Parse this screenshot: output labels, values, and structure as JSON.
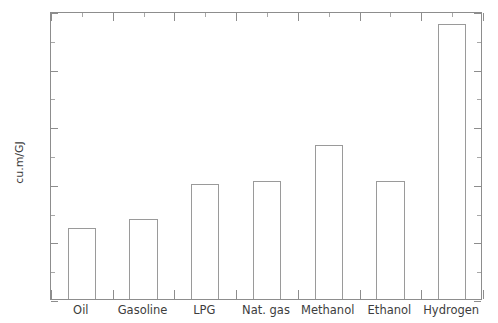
{
  "chart_data": {
    "type": "bar",
    "title": "",
    "subtitle": "",
    "xlabel": "",
    "ylabel": "cu.m/GJ",
    "categories": [
      "Oil",
      "Gasoline",
      "LPG",
      "Nat. gas",
      "Methanol",
      "Ethanol",
      "Hydrogen"
    ],
    "values": [
      0.0247,
      0.0278,
      0.0399,
      0.041,
      0.0535,
      0.041,
      0.0955
    ],
    "ylim": [
      0,
      0.1
    ],
    "xlim": [
      0,
      7
    ],
    "ytick_values": [
      0,
      0.02,
      0.04,
      0.06,
      0.08,
      0.1
    ],
    "ytick_labels": [
      "0",
      "0.02",
      "0.04",
      "0.06",
      "0.08",
      "0.1"
    ],
    "yminor_tick_values": [
      0.01,
      0.03,
      0.05,
      0.07,
      0.09
    ],
    "grid": false,
    "legend": null,
    "legend_position": "none",
    "bar_style": "outline",
    "bar_face_color": "#ffffff",
    "bar_edge_color": "#9a9a9a",
    "axis_color": "#8d8d8d",
    "background_color": "#ffffff",
    "text_color": "#3d3d3d",
    "annotations": []
  },
  "figure": {
    "width_px": 498,
    "height_px": 323
  }
}
